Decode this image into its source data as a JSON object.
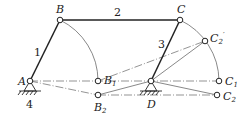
{
  "diagram": {
    "type": "four-bar linkage",
    "points": {
      "A": {
        "label": "A",
        "x": 30,
        "y": 81
      },
      "B": {
        "label": "B",
        "x": 60,
        "y": 20
      },
      "C": {
        "label": "C",
        "x": 180,
        "y": 20
      },
      "D": {
        "label": "D",
        "x": 151,
        "y": 81
      },
      "B1": {
        "label": "B",
        "sub": "1",
        "x": 98,
        "y": 81
      },
      "B2": {
        "label": "B",
        "sub": "2",
        "x": 98,
        "y": 95
      },
      "C1": {
        "label": "C",
        "sub": "1",
        "x": 219,
        "y": 81
      },
      "C2": {
        "label": "C",
        "sub": "2",
        "x": 217,
        "y": 95
      },
      "C2p": {
        "label": "C",
        "sub": "2",
        "prime": "′",
        "x": 205,
        "y": 41
      }
    },
    "links": {
      "l1": "1",
      "l2": "2",
      "l3": "3",
      "l4": "4"
    },
    "colors": {
      "stroke": "#333333",
      "background": "#ffffff"
    }
  }
}
